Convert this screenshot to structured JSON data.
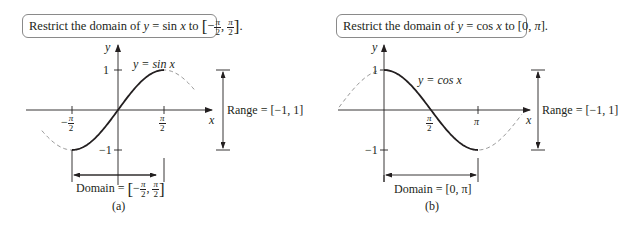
{
  "panels": [
    {
      "id": "a",
      "caption": "(a)",
      "box": {
        "prefix": "Restrict the domain of ",
        "y": "y",
        "eq": " = sin ",
        "x": "x",
        "to": " to "
      },
      "interval_box": {
        "neg": "−",
        "num": "π",
        "den": "2"
      },
      "curve_label": "y = sin x",
      "y_axis_label": "y",
      "x_axis_label": "x",
      "y_ticks": [
        "1",
        "−1"
      ],
      "x_ticks": [
        {
          "num": "π",
          "den": "2",
          "sign": "−"
        },
        {
          "num": "π",
          "den": "2",
          "sign": ""
        }
      ],
      "range_label": "Range = [−1, 1]",
      "domain_label_prefix": "Domain = "
    },
    {
      "id": "b",
      "caption": "(b)",
      "box_text_prefix": "Restrict the domain of ",
      "box_eq": " = cos ",
      "box_suffix": " to [0, ",
      "box_pi": "π",
      "box_end": "].",
      "curve_label": "y = cos x",
      "y_axis_label": "y",
      "x_axis_label": "x",
      "y_ticks": [
        "1",
        "−1"
      ],
      "x_ticks": [
        {
          "num": "π",
          "den": "2"
        },
        {
          "label": "π"
        }
      ],
      "range_label": "Range = [−1, 1]",
      "domain_label": "Domain = [0, π]"
    }
  ],
  "chart_data": [
    {
      "type": "line",
      "title": "Restrict the domain of y = sin x to [−π/2, π/2]",
      "series": [
        {
          "name": "y = sin x (restricted, solid)",
          "x_range": [
            -1.5708,
            1.5708
          ],
          "function": "sin"
        },
        {
          "name": "y = sin x (outside domain, dashed)",
          "x_range": [
            -2.6,
            2.6
          ],
          "function": "sin"
        }
      ],
      "xlabel": "x",
      "ylabel": "y",
      "x_ticks": [
        "−π/2",
        "π/2"
      ],
      "y_ticks": [
        "1",
        "−1"
      ],
      "domain": "[−π/2, π/2]",
      "range": "[−1, 1]",
      "caption": "(a)"
    },
    {
      "type": "line",
      "title": "Restrict the domain of y = cos x to [0, π]",
      "series": [
        {
          "name": "y = cos x (restricted, solid)",
          "x_range": [
            0,
            3.1416
          ],
          "function": "cos"
        },
        {
          "name": "y = cos x (outside domain, dashed)",
          "x_range": [
            -1.5,
            4.6
          ],
          "function": "cos"
        }
      ],
      "xlabel": "x",
      "ylabel": "y",
      "x_ticks": [
        "π/2",
        "π"
      ],
      "y_ticks": [
        "1",
        "−1"
      ],
      "domain": "[0, π]",
      "range": "[−1, 1]",
      "caption": "(b)"
    }
  ]
}
